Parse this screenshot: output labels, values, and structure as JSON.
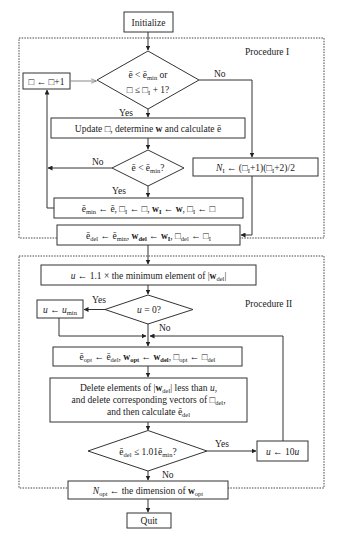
{
  "flowchart": {
    "start": "Initialize",
    "end": "Quit",
    "procedure_1": {
      "title": "Procedure I",
      "decision_1": {
        "line1": "ē < ē_min or",
        "line2": "□ ≤ □₁ + 1?",
        "yes": "Yes",
        "no": "No"
      },
      "increment_box": "□ ← □+1",
      "update_box": "Update □, determine w and calculate ē",
      "decision_2": {
        "text": "ē < ē_min?",
        "yes": "Yes",
        "no": "No"
      },
      "n1_box": "N₁ ← (□₁+1)(□₁+2)/2",
      "assign_min_box": "ē_min ← ē, □₁ ← □, w₁ ← w, □₁ ← □",
      "assign_del_box": "ē_del ← ē_min, w_del ← w₁, □_del ← □₁"
    },
    "procedure_2": {
      "title": "Procedure II",
      "u_init_box": "u ← 1.1 × the minimum element of |w_del|",
      "decision_u": {
        "text": "u = 0?",
        "yes": "Yes",
        "no": "No"
      },
      "u_min_box": "u ← u_min",
      "assign_opt_box": "ē_opt ← ē_del, w_opt ← w_del, □_opt ← □_del",
      "delete_box": {
        "line1": "Delete elements of |w_del| less than u,",
        "line2": "and delete corresponding vectors of □_del,",
        "line3": "and then calculate ē_del"
      },
      "decision_3": {
        "text": "ē_del ≤ 1.01ē_min?",
        "yes": "Yes",
        "no": "No"
      },
      "u_mult_box": "u ← 10u",
      "n_opt_box": "N_opt ← the dimension of w_opt"
    }
  }
}
